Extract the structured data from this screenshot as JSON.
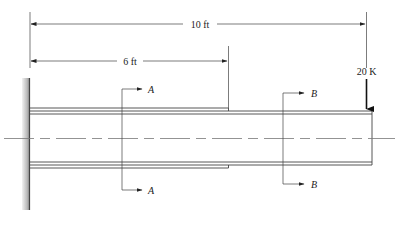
{
  "diagram": {
    "type": "cantilever-beam",
    "dimensions": {
      "overall": {
        "label": "10 ft"
      },
      "plated_length": {
        "label": "6 ft"
      }
    },
    "load": {
      "label": "20 K",
      "direction": "down"
    },
    "sections": [
      {
        "id": "A",
        "top_label": "A",
        "bottom_label": "A"
      },
      {
        "id": "B",
        "top_label": "B",
        "bottom_label": "B"
      }
    ],
    "colors": {
      "line": "#333333",
      "wall_dark": "#555555",
      "wall_light": "#d8d8d8",
      "centerline": "#777777"
    }
  }
}
